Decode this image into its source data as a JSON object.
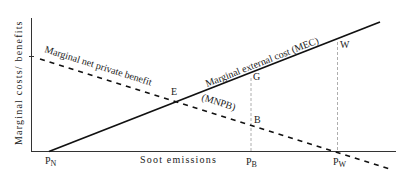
{
  "diagram": {
    "type": "economics-externality",
    "axes": {
      "y_label": "Marginal costs/ benefits",
      "x_label": "Soot emissions"
    },
    "curves": {
      "mec": {
        "label": "Marginal external cost (MEC)",
        "style": "solid"
      },
      "mnpb": {
        "label": "Marginal net private benefit",
        "abbrev": "(MNPB)",
        "style": "dashed"
      }
    },
    "points": {
      "E": "E",
      "G": "G",
      "B": "B",
      "W": "W"
    },
    "x_ticks": {
      "pn": {
        "main": "P",
        "sub": "N"
      },
      "pb": {
        "main": "P",
        "sub": "B"
      },
      "pw": {
        "main": "P",
        "sub": "W"
      }
    },
    "colors": {
      "line": "#111111",
      "guide": "#999999",
      "text": "#222222"
    }
  }
}
